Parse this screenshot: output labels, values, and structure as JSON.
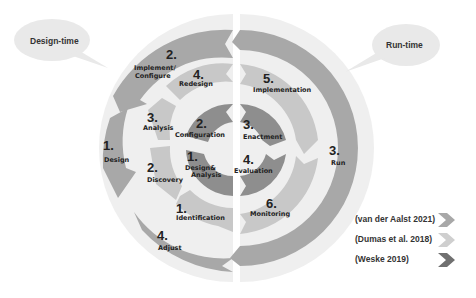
{
  "bubbles": {
    "design_time": "Design-time",
    "run_time": "Run-time"
  },
  "outer_ring": {
    "source": "van der Aalst 2021",
    "color": "#a8a8a8",
    "items": [
      {
        "num": "1.",
        "label": "Design"
      },
      {
        "num": "2.",
        "label1": "Implement/",
        "label2": "Configure"
      },
      {
        "num": "3.",
        "label": "Run"
      },
      {
        "num": "4.",
        "label": "Adjust"
      }
    ]
  },
  "middle_ring": {
    "source": "Dumas et al. 2018",
    "color": "#c8c8c8",
    "items": [
      {
        "num": "1.",
        "label": "Identification"
      },
      {
        "num": "2.",
        "label": "Discovery"
      },
      {
        "num": "3.",
        "label": "Analysis"
      },
      {
        "num": "4.",
        "label": "Redesign"
      },
      {
        "num": "5.",
        "label": "Implementation"
      },
      {
        "num": "6.",
        "label": "Monitoring"
      }
    ]
  },
  "inner_ring": {
    "source": "Weske 2019",
    "color": "#8e8e8e",
    "items": [
      {
        "num": "1.",
        "label1": "Design&",
        "label2": "Analysis"
      },
      {
        "num": "2.",
        "label": "Configuration"
      },
      {
        "num": "3.",
        "label": "Enactment"
      },
      {
        "num": "4.",
        "label": "Evaluation"
      }
    ]
  },
  "legend": [
    {
      "label": "(van der Aalst 2021)",
      "color": "#a8a8a8"
    },
    {
      "label": "(Dumas et al. 2018)",
      "color": "#cfcfcf"
    },
    {
      "label": "(Weske 2019)",
      "color": "#707070"
    }
  ]
}
